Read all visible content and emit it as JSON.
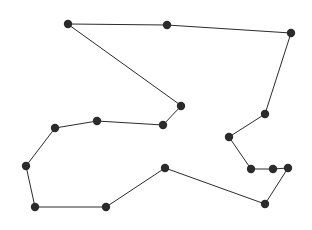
{
  "figure": {
    "background_color": "#ffffff",
    "width": 312,
    "height": 230
  },
  "chart_data": {
    "type": "scatter",
    "subtitle": "",
    "xlabel": "",
    "ylabel": "",
    "xlim": [
      0,
      312
    ],
    "ylim": [
      0,
      230
    ],
    "grid": false,
    "legend": null,
    "axes_visible": false,
    "tick_labels": [],
    "annotations": [],
    "closed": true,
    "vertex_count": 18,
    "marker": {
      "shape": "circle",
      "color": "#2b2b2b",
      "radius": 4.2
    },
    "line": {
      "color": "#2b2b2b",
      "width": 1,
      "style": "solid"
    },
    "x": [
      68,
      167,
      291,
      265,
      229,
      251,
      273,
      288,
      265,
      165,
      106,
      35,
      26,
      55,
      97,
      163,
      181,
      68
    ],
    "y": [
      24,
      25,
      33,
      114,
      137,
      169,
      169,
      168,
      204,
      168,
      207,
      207,
      166,
      128,
      121,
      125,
      106,
      24
    ],
    "points": [
      {
        "index": 1,
        "x": 68,
        "y": 24
      },
      {
        "index": 2,
        "x": 167,
        "y": 25
      },
      {
        "index": 3,
        "x": 291,
        "y": 33
      },
      {
        "index": 4,
        "x": 265,
        "y": 114
      },
      {
        "index": 5,
        "x": 229,
        "y": 137
      },
      {
        "index": 6,
        "x": 251,
        "y": 169
      },
      {
        "index": 7,
        "x": 273,
        "y": 169
      },
      {
        "index": 8,
        "x": 288,
        "y": 168
      },
      {
        "index": 9,
        "x": 265,
        "y": 204
      },
      {
        "index": 10,
        "x": 165,
        "y": 168
      },
      {
        "index": 11,
        "x": 106,
        "y": 207
      },
      {
        "index": 12,
        "x": 35,
        "y": 207
      },
      {
        "index": 13,
        "x": 26,
        "y": 166
      },
      {
        "index": 14,
        "x": 55,
        "y": 128
      },
      {
        "index": 15,
        "x": 97,
        "y": 121
      },
      {
        "index": 16,
        "x": 163,
        "y": 125
      },
      {
        "index": 17,
        "x": 181,
        "y": 106
      }
    ],
    "path_d": "M 68 24 L 167 25 L 291 33 L 265 114 L 229 137 L 251 169 L 273 169 L 288 168 L 265 204 L 165 168 L 106 207 L 35 207 L 26 166 L 55 128 L 97 121 L 163 125 L 181 106 Z"
  }
}
